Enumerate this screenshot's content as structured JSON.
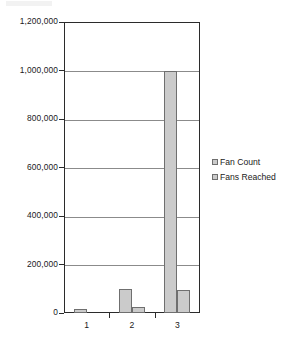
{
  "chart_data": {
    "type": "bar",
    "title": "",
    "subtitle": "",
    "xlabel": "",
    "ylabel": "",
    "categories": [
      "1",
      "2",
      "3"
    ],
    "series": [
      {
        "name": "Fan Count",
        "values": [
          15000,
          100000,
          1000000
        ]
      },
      {
        "name": "Fans Reached",
        "values": [
          1000,
          25000,
          95000
        ]
      }
    ],
    "ylim": [
      0,
      1200000
    ],
    "ytick_values": [
      0,
      200000,
      400000,
      600000,
      800000,
      1000000,
      1200000
    ],
    "ytick_labels": [
      "0",
      "200,000",
      "400,000",
      "600,000",
      "800,000",
      "1,000,000",
      "1,200,000"
    ],
    "grid": true,
    "grid_axis": "y",
    "legend_position": "right",
    "bar_fill_color": "#cbcbcb",
    "bar_border_color": "#6f6f6f",
    "axis_color": "#2b2b2b",
    "gridline_color": "#8b8b8b",
    "background_color": "#ffffff"
  },
  "legend": {
    "items": [
      {
        "label": "Fan Count",
        "swatch_color": "#cbcbcb"
      },
      {
        "label": "Fans Reached",
        "swatch_color": "#cbcbcb"
      }
    ]
  }
}
